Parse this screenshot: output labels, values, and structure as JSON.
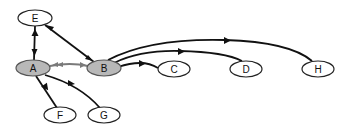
{
  "diagram": {
    "type": "directed-graph",
    "colors": {
      "edge": "#111111",
      "edge_gray": "#7a7a7a",
      "node_fill_default": "#ffffff",
      "node_fill_highlight": "#b8b8b8",
      "node_stroke": "#222222"
    },
    "nodes": [
      {
        "id": "E",
        "label": "E",
        "cx": 35,
        "cy": 18,
        "highlight": false
      },
      {
        "id": "A",
        "label": "A",
        "cx": 33,
        "cy": 68,
        "highlight": true
      },
      {
        "id": "B",
        "label": "B",
        "cx": 104,
        "cy": 68,
        "highlight": true
      },
      {
        "id": "C",
        "label": "C",
        "cx": 174,
        "cy": 69,
        "highlight": false
      },
      {
        "id": "D",
        "label": "D",
        "cx": 246,
        "cy": 69,
        "highlight": false
      },
      {
        "id": "H",
        "label": "H",
        "cx": 318,
        "cy": 69,
        "highlight": false
      },
      {
        "id": "F",
        "label": "F",
        "cx": 60,
        "cy": 115,
        "highlight": false
      },
      {
        "id": "G",
        "label": "G",
        "cx": 104,
        "cy": 115,
        "highlight": false
      }
    ],
    "edges": [
      {
        "from": "A",
        "to": "E",
        "bidirectional": true,
        "color": "dark"
      },
      {
        "from": "E",
        "to": "B",
        "bidirectional": true,
        "color": "dark"
      },
      {
        "from": "A",
        "to": "B",
        "bidirectional": true,
        "color": "gray"
      },
      {
        "from": "B",
        "to": "C",
        "bidirectional": false,
        "color": "dark"
      },
      {
        "from": "B",
        "to": "D",
        "bidirectional": false,
        "color": "dark"
      },
      {
        "from": "B",
        "to": "H",
        "bidirectional": false,
        "color": "dark"
      },
      {
        "from": "A",
        "to": "F",
        "bidirectional": false,
        "color": "dark"
      },
      {
        "from": "A",
        "to": "G",
        "bidirectional": false,
        "color": "dark"
      }
    ]
  }
}
